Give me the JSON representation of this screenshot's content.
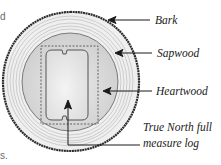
{
  "diagram": {
    "labels": {
      "bark": "Bark",
      "sapwood": "Sapwood",
      "heartwood": "Heartwood",
      "true_north_line1": "True North full",
      "true_north_line2": "measure log"
    },
    "fragments": {
      "top_left": "d",
      "bottom_left": "s."
    },
    "colors": {
      "bark": "#2b2b2b",
      "sapwood": "#ececec",
      "sapwood_rings": "#b9b9b9",
      "heartwood": "#d6d6d6",
      "log_profile": "#e6e6e6",
      "arrows": "#1a1a1a",
      "dashed_square": "#555555"
    }
  }
}
